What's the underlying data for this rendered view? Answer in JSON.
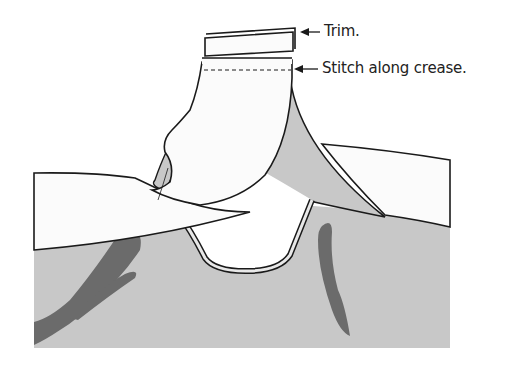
{
  "diagram": {
    "labels": [
      {
        "id": "trim",
        "text": "Trim."
      },
      {
        "id": "stitch",
        "text": "Stitch along crease."
      }
    ],
    "colors": {
      "fabric_gray": "#c8c8c8",
      "shadow_gray": "#6b6b6b",
      "paper_white": "#fbfbfb",
      "outline": "#1a1a1a"
    }
  }
}
